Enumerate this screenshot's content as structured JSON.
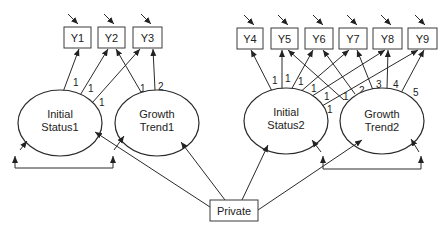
{
  "diagram": {
    "observed": [
      {
        "id": "Y1",
        "label": "Y1"
      },
      {
        "id": "Y2",
        "label": "Y2"
      },
      {
        "id": "Y3",
        "label": "Y3"
      },
      {
        "id": "Y4",
        "label": "Y4"
      },
      {
        "id": "Y5",
        "label": "Y5"
      },
      {
        "id": "Y6",
        "label": "Y6"
      },
      {
        "id": "Y7",
        "label": "Y7"
      },
      {
        "id": "Y8",
        "label": "Y8"
      },
      {
        "id": "Y9",
        "label": "Y9"
      }
    ],
    "latent": [
      {
        "id": "IS1",
        "line1": "Initial",
        "line2": "Status1"
      },
      {
        "id": "GT1",
        "line1": "Growth",
        "line2": "Trend1"
      },
      {
        "id": "IS2",
        "line1": "Initial",
        "line2": "Status2"
      },
      {
        "id": "GT2",
        "line1": "Growth",
        "line2": "Trend2"
      }
    ],
    "covariate": {
      "id": "Private",
      "label": "Private"
    },
    "loadings": {
      "IS1_Y1": "1",
      "IS1_Y2": "1",
      "IS1_Y3": "1",
      "GT1_Y2": "1",
      "GT1_Y3": "2",
      "IS2_Y4": "1",
      "IS2_Y5": "1",
      "IS2_Y6": "1",
      "IS2_Y7": "1",
      "IS2_Y8": "1",
      "IS2_Y9": "1",
      "GT2_Y5": "1",
      "GT2_Y6": "2",
      "GT2_Y7": "3",
      "GT2_Y8": "4",
      "GT2_Y9": "5"
    }
  }
}
